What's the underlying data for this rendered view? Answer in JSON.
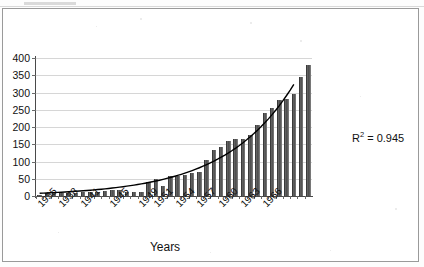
{
  "chart_data": {
    "type": "bar",
    "title": "",
    "xlabel": "Years",
    "ylabel": "",
    "ylim": [
      0,
      400
    ],
    "ytick_step": 50,
    "yticks": [
      0,
      50,
      100,
      150,
      200,
      250,
      300,
      350,
      400
    ],
    "grid": true,
    "legend": false,
    "annotation": "R2 = 0.945",
    "annotation_parts": {
      "symbol": "R",
      "exponent": "2",
      "equals_value": "= 0.945"
    },
    "series_name": "Values",
    "trendline": {
      "type": "exponential",
      "r_squared": 0.945,
      "label": "R2 = 0.945"
    },
    "categories": [
      "1935",
      "1936",
      "1937",
      "1938",
      "1939",
      "1940",
      "1941",
      "1942",
      "1943",
      "1944",
      "1945",
      "1946",
      "1947",
      "1948",
      "1949",
      "1950",
      "1951",
      "1952",
      "1953",
      "1954",
      "1955",
      "1956",
      "1957",
      "1958",
      "1959",
      "1960",
      "1961",
      "1962",
      "1963",
      "1964",
      "1965",
      "1966",
      "1967",
      "1968"
    ],
    "values": [
      3,
      8,
      9,
      9,
      9,
      10,
      11,
      12,
      13,
      14,
      16,
      18,
      11,
      12,
      13,
      40,
      48,
      30,
      57,
      58,
      62,
      66,
      70,
      104,
      133,
      141,
      160,
      166,
      165,
      178,
      206,
      240,
      255,
      278
    ],
    "values_tail": [
      281,
      297,
      344,
      381
    ],
    "xtick_labels_shown": [
      "1935",
      "1938",
      "1941",
      "1945",
      "1949",
      "1951",
      "1954",
      "1957",
      "1960",
      "1963",
      "1966"
    ],
    "bar_color": "#555555",
    "trend_color": "#000000",
    "grid_color": "#d6d6d6",
    "axis_color": "#4a4a4a"
  },
  "figure": {
    "axis_title_text": "Years",
    "r2_symbol": "R",
    "r2_exponent": "2",
    "r2_value": "= 0.945"
  }
}
